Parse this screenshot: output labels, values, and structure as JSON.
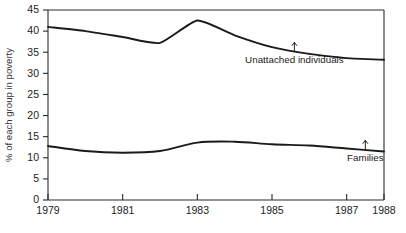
{
  "chart_data": {
    "type": "line",
    "title": "",
    "xlabel": "",
    "ylabel": "% of each group in poverty",
    "xlim": [
      1979,
      1988
    ],
    "ylim": [
      0,
      45
    ],
    "y_ticks": [
      0,
      5,
      10,
      15,
      20,
      25,
      30,
      35,
      40,
      45
    ],
    "x_ticks": [
      1979,
      1981,
      1983,
      1985,
      1987,
      1988
    ],
    "x_tick_labels": [
      "1979",
      "1981",
      "1983",
      "1985",
      "1987",
      "1988"
    ],
    "grid": false,
    "legend": "annotations",
    "series": [
      {
        "name": "Unattached individuals",
        "x": [
          1979,
          1980,
          1981,
          1982,
          1983,
          1984,
          1985,
          1986,
          1987,
          1988
        ],
        "values": [
          41.0,
          40.0,
          38.6,
          37.2,
          42.5,
          39.0,
          36.2,
          34.6,
          33.6,
          33.2
        ]
      },
      {
        "name": "Families",
        "x": [
          1979,
          1980,
          1981,
          1982,
          1983,
          1984,
          1985,
          1986,
          1987,
          1988
        ],
        "values": [
          12.8,
          11.6,
          11.2,
          11.6,
          13.6,
          13.8,
          13.2,
          12.9,
          12.2,
          11.5
        ]
      }
    ],
    "annotations": [
      {
        "label": "Unattached individuals",
        "x": 1985.6,
        "y": 35.2,
        "arrow": "up"
      },
      {
        "label": "Families",
        "x": 1987.5,
        "y": 12.0,
        "arrow": "up"
      }
    ],
    "colors": {
      "line": "#1a1a1a",
      "axis": "#2b2b2b",
      "background": "#ffffff"
    }
  }
}
